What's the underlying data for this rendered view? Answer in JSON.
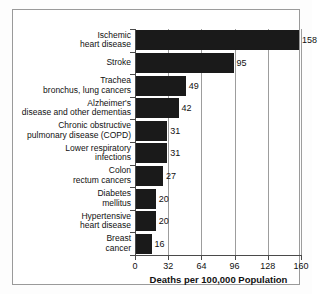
{
  "chart_data": {
    "type": "bar",
    "orientation": "horizontal",
    "title": "",
    "xlabel": "Deaths per 100,000 Population",
    "ylabel": "",
    "xlim": [
      0,
      160
    ],
    "xticks": [
      0,
      32,
      64,
      96,
      128,
      160
    ],
    "xtick_labels": [
      "0",
      "32",
      "64",
      "96",
      "128",
      "160"
    ],
    "grid": true,
    "grid_axis": "x",
    "legend": false,
    "bar_color": "#1a1a1a",
    "categories": [
      "Ischemic\nheart disease",
      "Stroke",
      "Trachea\nbronchus, lung cancers",
      "Alzheimer's\ndisease and other dementias",
      "Chronic obstructive\npulmonary disease (COPD)",
      "Lower respiratory\ninfections",
      "Colon\nrectum cancers",
      "Diabetes\nmellitus",
      "Hypertensive\nheart disease",
      "Breast\ncancer"
    ],
    "values": [
      158,
      95,
      49,
      42,
      31,
      31,
      27,
      20,
      20,
      16
    ],
    "data_labels": [
      "158",
      "95",
      "49",
      "42",
      "31",
      "31",
      "27",
      "20",
      "20",
      "16"
    ]
  },
  "categories_display": [
    {
      "line1": "Ischemic",
      "line2": "heart disease"
    },
    {
      "line1": "Stroke",
      "line2": ""
    },
    {
      "line1": "Trachea",
      "line2": "bronchus, lung cancers"
    },
    {
      "line1": "Alzheimer's",
      "line2": "disease and other dementias"
    },
    {
      "line1": "Chronic obstructive",
      "line2": "pulmonary disease (COPD)"
    },
    {
      "line1": "Lower respiratory",
      "line2": "infections"
    },
    {
      "line1": "Colon",
      "line2": "rectum cancers"
    },
    {
      "line1": "Diabetes",
      "line2": "mellitus"
    },
    {
      "line1": "Hypertensive",
      "line2": "heart disease"
    },
    {
      "line1": "Breast",
      "line2": "cancer"
    }
  ]
}
